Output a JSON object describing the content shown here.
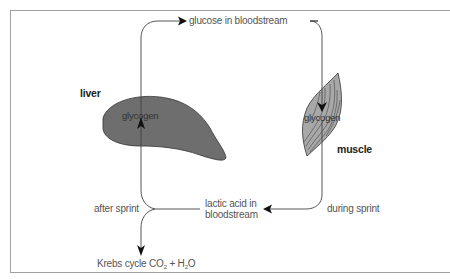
{
  "diagram": {
    "organs": {
      "liver": {
        "label": "liver",
        "inner_label": "glycogen",
        "fill": "#6e6e6e"
      },
      "muscle": {
        "label": "muscle",
        "inner_label": "glycogen",
        "fill": "#a8a8a8"
      }
    },
    "nodes": {
      "glucose": "glucose in bloodstream",
      "lactic_line1": "lactic acid in",
      "lactic_line2": "bloodstream",
      "krebs_prefix": "Krebs cycle CO",
      "krebs_sub1": "2",
      "krebs_mid": " + H",
      "krebs_sub2": "2",
      "krebs_suffix": "O"
    },
    "edge_labels": {
      "after_sprint": "after sprint",
      "during_sprint": "during sprint"
    },
    "edges": [
      {
        "from": "liver glycogen",
        "to": "glucose in bloodstream"
      },
      {
        "from": "glucose in bloodstream",
        "to": "muscle glycogen"
      },
      {
        "from": "muscle glycogen",
        "to": "lactic acid in bloodstream",
        "label": "during sprint"
      },
      {
        "from": "lactic acid in bloodstream",
        "to": "liver glycogen",
        "label": "after sprint"
      },
      {
        "from": "lactic acid in bloodstream",
        "to": "Krebs cycle CO2 + H2O",
        "label": "after sprint"
      }
    ],
    "colors": {
      "line": "#444444",
      "frame": "#9a9a9a",
      "text": "#555555"
    }
  }
}
